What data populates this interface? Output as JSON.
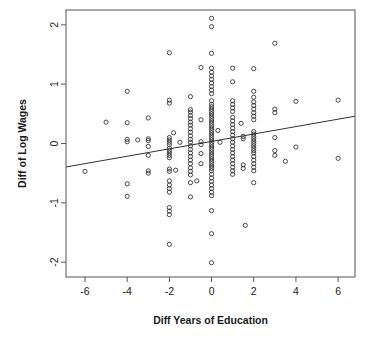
{
  "chart_data": {
    "type": "scatter",
    "title": "",
    "xlabel": "Diff Years of Education",
    "ylabel": "Diff of Log Wages",
    "xlim": [
      -6.9,
      6.8
    ],
    "ylim": [
      -2.25,
      2.25
    ],
    "xticks": [
      -6,
      -4,
      -2,
      0,
      2,
      4,
      6
    ],
    "xtick_labels": [
      "-6",
      "-4",
      "-2",
      "0",
      "2",
      "4",
      "6"
    ],
    "yticks": [
      -2,
      -1,
      0,
      1,
      2
    ],
    "ytick_labels": [
      "-2",
      "-1",
      "0",
      "1",
      "2"
    ],
    "grid": false,
    "legend": null,
    "marker": "open-circle",
    "marker_color": "#2a2a2a",
    "background": "#ffffff",
    "frame_color": "#555555",
    "fit_line": {
      "label": "least-squares fit",
      "color": "#333333",
      "intercept": 0.035,
      "slope": 0.0625,
      "x_start": -6.9,
      "y_start": -0.396,
      "x_end": 6.8,
      "y_end": 0.46
    },
    "points": [
      [
        -6.0,
        -0.47
      ],
      [
        -5.0,
        0.36
      ],
      [
        -4.0,
        0.88
      ],
      [
        -4.0,
        0.35
      ],
      [
        -4.0,
        0.07
      ],
      [
        -4.0,
        0.03
      ],
      [
        -4.0,
        -0.68
      ],
      [
        -4.0,
        -0.89
      ],
      [
        -3.5,
        0.06
      ],
      [
        -3.0,
        0.43
      ],
      [
        -3.0,
        0.08
      ],
      [
        -3.0,
        0.05
      ],
      [
        -3.0,
        -0.05
      ],
      [
        -3.0,
        -0.2
      ],
      [
        -3.0,
        -0.46
      ],
      [
        -3.0,
        -0.5
      ],
      [
        -2.0,
        1.53
      ],
      [
        -2.0,
        0.73
      ],
      [
        -2.0,
        0.68
      ],
      [
        -2.0,
        0.1
      ],
      [
        -2.0,
        0.06
      ],
      [
        -2.0,
        0.02
      ],
      [
        -2.0,
        -0.02
      ],
      [
        -2.0,
        -0.08
      ],
      [
        -2.0,
        -0.12
      ],
      [
        -2.0,
        -0.16
      ],
      [
        -2.0,
        -0.2
      ],
      [
        -2.0,
        -0.24
      ],
      [
        -2.0,
        -0.43
      ],
      [
        -2.0,
        -0.47
      ],
      [
        -2.0,
        -0.63
      ],
      [
        -2.0,
        -0.7
      ],
      [
        -2.0,
        -0.76
      ],
      [
        -2.0,
        -0.82
      ],
      [
        -2.0,
        -1.08
      ],
      [
        -2.0,
        -1.14
      ],
      [
        -2.0,
        -1.2
      ],
      [
        -2.0,
        -1.7
      ],
      [
        -1.8,
        0.18
      ],
      [
        -1.7,
        -0.45
      ],
      [
        -1.5,
        0.02
      ],
      [
        -1.0,
        0.79
      ],
      [
        -1.0,
        0.57
      ],
      [
        -1.0,
        0.53
      ],
      [
        -1.0,
        0.47
      ],
      [
        -1.0,
        0.42
      ],
      [
        -1.0,
        0.36
      ],
      [
        -1.0,
        0.31
      ],
      [
        -1.0,
        0.25
      ],
      [
        -1.0,
        0.19
      ],
      [
        -1.0,
        0.13
      ],
      [
        -1.0,
        0.07
      ],
      [
        -1.0,
        0.02
      ],
      [
        -1.0,
        -0.04
      ],
      [
        -1.0,
        -0.1
      ],
      [
        -1.0,
        -0.16
      ],
      [
        -1.0,
        -0.22
      ],
      [
        -1.0,
        -0.28
      ],
      [
        -1.0,
        -0.34
      ],
      [
        -1.0,
        -0.41
      ],
      [
        -1.0,
        -0.47
      ],
      [
        -1.0,
        -0.53
      ],
      [
        -1.0,
        -0.66
      ],
      [
        -1.0,
        -0.9
      ],
      [
        -0.7,
        -0.63
      ],
      [
        -0.5,
        1.28
      ],
      [
        -0.5,
        0.4
      ],
      [
        -0.5,
        0.03
      ],
      [
        -0.5,
        -0.02
      ],
      [
        -0.5,
        -0.17
      ],
      [
        -0.5,
        -0.34
      ],
      [
        0.0,
        2.11
      ],
      [
        0.0,
        1.97
      ],
      [
        0.0,
        1.52
      ],
      [
        0.0,
        1.27
      ],
      [
        0.0,
        1.2
      ],
      [
        0.0,
        1.14
      ],
      [
        0.0,
        1.08
      ],
      [
        0.0,
        1.02
      ],
      [
        0.0,
        0.96
      ],
      [
        0.0,
        0.9
      ],
      [
        0.0,
        0.84
      ],
      [
        0.0,
        0.72
      ],
      [
        0.0,
        0.66
      ],
      [
        0.0,
        0.62
      ],
      [
        0.0,
        0.58
      ],
      [
        0.0,
        0.54
      ],
      [
        0.0,
        0.5
      ],
      [
        0.0,
        0.46
      ],
      [
        0.0,
        0.42
      ],
      [
        0.0,
        0.38
      ],
      [
        0.0,
        0.34
      ],
      [
        0.0,
        0.3
      ],
      [
        0.0,
        0.26
      ],
      [
        0.0,
        0.22
      ],
      [
        0.0,
        0.18
      ],
      [
        0.0,
        0.14
      ],
      [
        0.0,
        0.1
      ],
      [
        0.0,
        0.06
      ],
      [
        0.0,
        0.02
      ],
      [
        0.0,
        -0.02
      ],
      [
        0.0,
        -0.06
      ],
      [
        0.0,
        -0.1
      ],
      [
        0.0,
        -0.14
      ],
      [
        0.0,
        -0.18
      ],
      [
        0.0,
        -0.22
      ],
      [
        0.0,
        -0.26
      ],
      [
        0.0,
        -0.3
      ],
      [
        0.0,
        -0.34
      ],
      [
        0.0,
        -0.38
      ],
      [
        0.0,
        -0.42
      ],
      [
        0.0,
        -0.46
      ],
      [
        0.0,
        -0.52
      ],
      [
        0.0,
        -0.58
      ],
      [
        0.0,
        -0.64
      ],
      [
        0.0,
        -0.7
      ],
      [
        0.0,
        -0.76
      ],
      [
        0.0,
        -0.82
      ],
      [
        0.0,
        -0.88
      ],
      [
        0.0,
        -1.13
      ],
      [
        0.0,
        -1.52
      ],
      [
        0.0,
        -2.01
      ],
      [
        0.3,
        0.22
      ],
      [
        0.4,
        0.02
      ],
      [
        1.0,
        1.27
      ],
      [
        1.0,
        1.04
      ],
      [
        1.0,
        0.72
      ],
      [
        1.0,
        0.66
      ],
      [
        1.0,
        0.6
      ],
      [
        1.0,
        0.54
      ],
      [
        1.0,
        0.44
      ],
      [
        1.0,
        0.38
      ],
      [
        1.0,
        0.32
      ],
      [
        1.0,
        0.26
      ],
      [
        1.0,
        0.2
      ],
      [
        1.0,
        0.14
      ],
      [
        1.0,
        0.08
      ],
      [
        1.0,
        0.02
      ],
      [
        1.0,
        -0.04
      ],
      [
        1.0,
        -0.1
      ],
      [
        1.0,
        -0.16
      ],
      [
        1.0,
        -0.22
      ],
      [
        1.0,
        -0.28
      ],
      [
        1.0,
        -0.34
      ],
      [
        1.0,
        -0.4
      ],
      [
        1.0,
        -0.46
      ],
      [
        1.0,
        -0.52
      ],
      [
        1.4,
        0.34
      ],
      [
        1.5,
        0.12
      ],
      [
        1.5,
        0.08
      ],
      [
        1.5,
        -0.36
      ],
      [
        1.5,
        -0.42
      ],
      [
        1.6,
        -1.38
      ],
      [
        2.0,
        1.26
      ],
      [
        2.0,
        0.88
      ],
      [
        2.0,
        0.78
      ],
      [
        2.0,
        0.7
      ],
      [
        2.0,
        0.64
      ],
      [
        2.0,
        0.58
      ],
      [
        2.0,
        0.52
      ],
      [
        2.0,
        0.46
      ],
      [
        2.0,
        0.4
      ],
      [
        2.0,
        0.2
      ],
      [
        2.0,
        0.16
      ],
      [
        2.0,
        0.12
      ],
      [
        2.0,
        0.08
      ],
      [
        2.0,
        0.04
      ],
      [
        2.0,
        0.0
      ],
      [
        2.0,
        -0.04
      ],
      [
        2.0,
        -0.08
      ],
      [
        2.0,
        -0.12
      ],
      [
        2.0,
        -0.16
      ],
      [
        2.0,
        -0.22
      ],
      [
        2.0,
        -0.28
      ],
      [
        2.0,
        -0.34
      ],
      [
        2.0,
        -0.4
      ],
      [
        2.0,
        -0.46
      ],
      [
        2.0,
        -0.66
      ],
      [
        3.0,
        1.69
      ],
      [
        3.0,
        0.58
      ],
      [
        3.0,
        0.52
      ],
      [
        3.0,
        0.1
      ],
      [
        3.0,
        -0.12
      ],
      [
        3.0,
        -0.2
      ],
      [
        3.5,
        -0.3
      ],
      [
        4.0,
        0.71
      ],
      [
        4.0,
        -0.06
      ],
      [
        6.0,
        0.73
      ],
      [
        6.0,
        -0.25
      ]
    ]
  },
  "axes": {
    "x_title": "Diff Years of Education",
    "y_title": "Diff of Log Wages"
  }
}
